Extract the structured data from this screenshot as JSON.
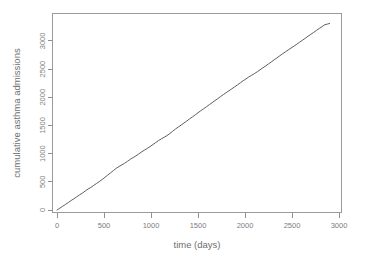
{
  "figure": {
    "background_color": "#ffffff",
    "line_color": "#5d5d5d",
    "axis_color": "#909090",
    "text_color": "#7d7d7d"
  },
  "chart_data": {
    "type": "line",
    "title": "",
    "xlabel": "time (days)",
    "ylabel": "cumulative asthma admissions",
    "xlim": [
      0,
      3000
    ],
    "ylim": [
      0,
      3300
    ],
    "xticks": [
      0,
      500,
      1000,
      1500,
      2000,
      2500,
      3000
    ],
    "xtick_labels": [
      "0",
      "500",
      "1000",
      "1500",
      "2000",
      "2500",
      "3000"
    ],
    "yticks": [
      0,
      500,
      1000,
      1500,
      2000,
      2500,
      3000
    ],
    "ytick_labels": [
      "0",
      "500",
      "1000",
      "1500",
      "2000",
      "2500",
      "3000"
    ],
    "grid": false,
    "legend": false,
    "series": [
      {
        "name": "cumulative asthma admissions",
        "x": [
          0,
          30,
          60,
          90,
          120,
          150,
          180,
          210,
          240,
          270,
          300,
          330,
          360,
          390,
          420,
          450,
          480,
          510,
          540,
          570,
          600,
          630,
          660,
          690,
          720,
          750,
          780,
          810,
          840,
          870,
          900,
          930,
          960,
          990,
          1020,
          1050,
          1080,
          1110,
          1140,
          1170,
          1200,
          1230,
          1260,
          1290,
          1320,
          1350,
          1380,
          1410,
          1440,
          1470,
          1500,
          1530,
          1560,
          1590,
          1620,
          1650,
          1680,
          1710,
          1740,
          1770,
          1800,
          1830,
          1860,
          1890,
          1920,
          1950,
          1980,
          2010,
          2040,
          2070,
          2100,
          2130,
          2160,
          2190,
          2220,
          2250,
          2280,
          2310,
          2340,
          2370,
          2400,
          2430,
          2460,
          2490,
          2520,
          2550,
          2580,
          2610,
          2640,
          2670,
          2700,
          2730,
          2760,
          2790,
          2820,
          2850,
          2880,
          2900
        ],
        "y": [
          0,
          32,
          66,
          98,
          132,
          168,
          200,
          234,
          268,
          300,
          336,
          372,
          400,
          436,
          470,
          504,
          540,
          580,
          620,
          660,
          700,
          740,
          772,
          800,
          830,
          864,
          900,
          930,
          960,
          995,
          1030,
          1062,
          1092,
          1125,
          1160,
          1196,
          1232,
          1262,
          1290,
          1320,
          1356,
          1396,
          1436,
          1472,
          1506,
          1542,
          1578,
          1616,
          1650,
          1688,
          1726,
          1762,
          1796,
          1832,
          1868,
          1904,
          1940,
          1976,
          2012,
          2048,
          2082,
          2116,
          2150,
          2186,
          2220,
          2256,
          2292,
          2326,
          2360,
          2390,
          2420,
          2452,
          2488,
          2522,
          2556,
          2592,
          2628,
          2664,
          2700,
          2736,
          2772,
          2806,
          2840,
          2874,
          2906,
          2940,
          2976,
          3010,
          3046,
          3082,
          3116,
          3150,
          3186,
          3220,
          3254,
          3288,
          3300,
          3310
        ]
      }
    ]
  }
}
